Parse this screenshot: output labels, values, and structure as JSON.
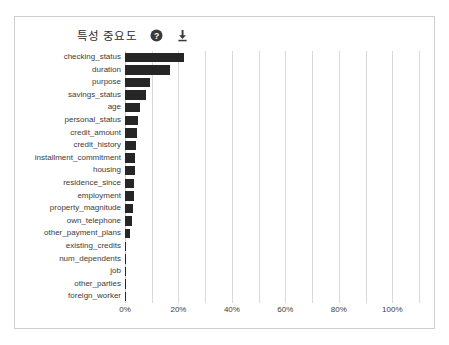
{
  "header": {
    "title": "특성 중요도",
    "help_icon": "help-circle-icon",
    "download_icon": "download-icon"
  },
  "colors": {
    "bar": "#262626",
    "gridline": "#d9d9d9",
    "axis": "#c9c9c9",
    "text": "#3c3c3c",
    "frame": "#cfcfcf",
    "background": "#ffffff"
  },
  "chart_data": {
    "type": "bar",
    "orientation": "horizontal",
    "title": "특성 중요도",
    "xlabel": "",
    "ylabel": "",
    "xlim": [
      0,
      110
    ],
    "grid": true,
    "legend": false,
    "xticks": [
      "0%",
      "20%",
      "40%",
      "60%",
      "80%",
      "100%"
    ],
    "xtick_values": [
      0,
      20,
      40,
      60,
      80,
      100
    ],
    "gridline_values": [
      0,
      10,
      20,
      30,
      40,
      50,
      60,
      70,
      80,
      90,
      100,
      110
    ],
    "categories": [
      "checking_status",
      "duration",
      "purpose",
      "savings_status",
      "age",
      "personal_status",
      "credit_amount",
      "credit_history",
      "installment_commitment",
      "housing",
      "residence_since",
      "employment",
      "property_magnitude",
      "own_telephone",
      "other_payment_plans",
      "existing_credits",
      "num_dependents",
      "job",
      "other_parties",
      "foreign_worker"
    ],
    "values": [
      22.0,
      17.0,
      9.5,
      8.0,
      5.5,
      4.7,
      4.5,
      4.1,
      3.8,
      3.6,
      3.3,
      3.2,
      3.0,
      2.6,
      2.0,
      0.3,
      0.2,
      0.2,
      0.1,
      0.1
    ]
  }
}
